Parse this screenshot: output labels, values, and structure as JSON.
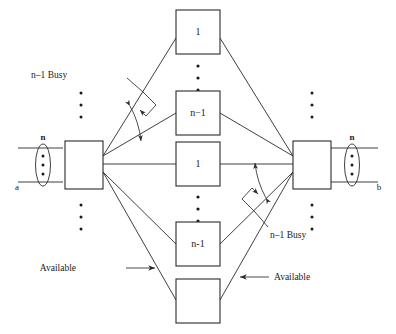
{
  "figure": {
    "background_color": "#ffffff",
    "line_color": "#2a2a2a"
  },
  "left_switch": {
    "name": "left-switch-box",
    "trunk_label": "n",
    "endpoint_label": "a"
  },
  "right_switch": {
    "name": "right-switch-box",
    "trunk_label": "n",
    "endpoint_label": "b"
  },
  "middle_boxes": [
    {
      "label": "1",
      "group": "upper"
    },
    {
      "label": "n−1",
      "group": "upper"
    },
    {
      "label": "1",
      "group": "middle"
    },
    {
      "label": "n-1",
      "group": "lower"
    },
    {
      "label": "",
      "group": "bottom"
    }
  ],
  "annotations": {
    "busy_left": "n–1 Busy",
    "busy_right": "n–1 Busy",
    "available_left": "Available",
    "available_right": "Available"
  },
  "vertical_dots": {
    "count_per_group": 3,
    "glyph": "·"
  }
}
